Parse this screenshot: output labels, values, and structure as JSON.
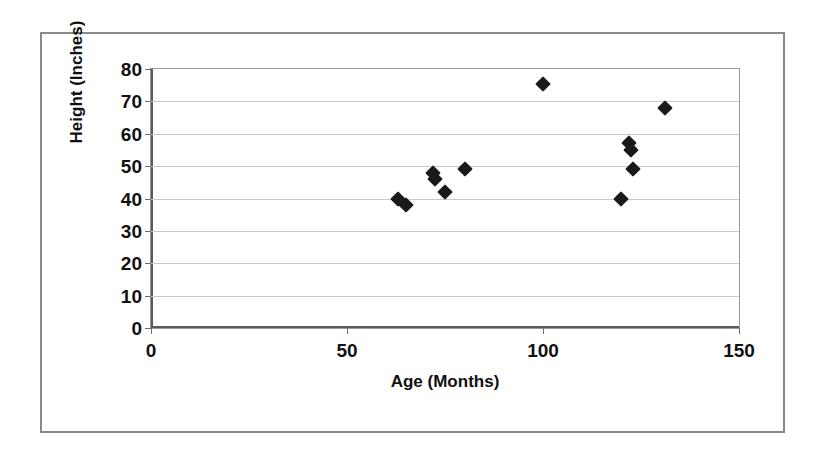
{
  "chart_data": {
    "type": "scatter",
    "title": "",
    "xlabel": "Age (Months)",
    "ylabel": "Height (Inches)",
    "xlim": [
      0,
      150
    ],
    "ylim": [
      0,
      80
    ],
    "xticks": [
      0,
      50,
      100,
      150
    ],
    "yticks": [
      0,
      10,
      20,
      30,
      40,
      50,
      60,
      70,
      80
    ],
    "grid": "horizontal",
    "legend": "none",
    "marker": "filled-diamond",
    "marker_color": "#1a1a1a",
    "series": [
      {
        "name": "Height vs Age",
        "points": [
          {
            "x": 63,
            "y": 40
          },
          {
            "x": 65,
            "y": 38
          },
          {
            "x": 72,
            "y": 48
          },
          {
            "x": 72.5,
            "y": 46
          },
          {
            "x": 75,
            "y": 42
          },
          {
            "x": 80,
            "y": 49
          },
          {
            "x": 100,
            "y": 75.5
          },
          {
            "x": 120,
            "y": 40
          },
          {
            "x": 122,
            "y": 57
          },
          {
            "x": 122.5,
            "y": 55
          },
          {
            "x": 123,
            "y": 49
          },
          {
            "x": 131,
            "y": 68
          }
        ]
      }
    ]
  }
}
